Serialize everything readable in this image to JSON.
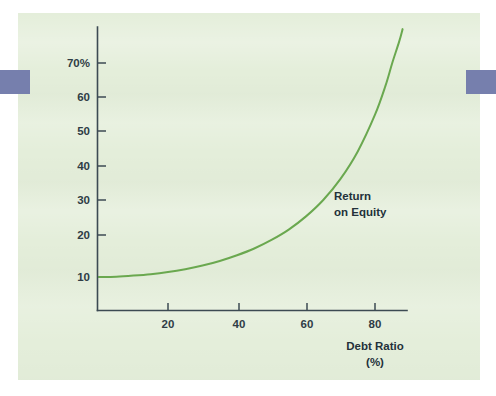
{
  "figure": {
    "panel_color": "#e4eeda",
    "page_background": "#ffffff",
    "edge_tab_color": "#767fad",
    "axis_color": "#3c4a53",
    "curve_color": "#6aa84f",
    "text_color": "#23313a"
  },
  "chart_data": {
    "type": "line",
    "title": "",
    "subtitle": "",
    "xlabel": "Debt Ratio",
    "xlabel_unit": "(%)",
    "ylabel": "",
    "ytick_labels": [
      "70%",
      "60",
      "50",
      "40",
      "30",
      "20",
      "10"
    ],
    "ytick_values": [
      70,
      60,
      50,
      40,
      30,
      20,
      10
    ],
    "xtick_labels": [
      "20",
      "40",
      "60",
      "80"
    ],
    "xtick_values": [
      20,
      40,
      60,
      80
    ],
    "xlim": [
      0,
      90
    ],
    "ylim": [
      0,
      80
    ],
    "grid": false,
    "legend_position": "inline-annotation",
    "series": [
      {
        "name": "Return on Equity",
        "annotation_lines": [
          "Return",
          "on Equity"
        ],
        "x": [
          0,
          5,
          10,
          15,
          20,
          25,
          30,
          35,
          40,
          45,
          50,
          55,
          60,
          65,
          70,
          75,
          80,
          83,
          85,
          87,
          88
        ],
        "y": [
          10.0,
          10.1,
          10.4,
          10.8,
          11.4,
          12.2,
          13.2,
          14.5,
          16.1,
          18.0,
          20.4,
          23.3,
          27.0,
          31.6,
          37.5,
          45.2,
          55.5,
          63.5,
          70.0,
          76.0,
          79.5
        ]
      }
    ]
  }
}
